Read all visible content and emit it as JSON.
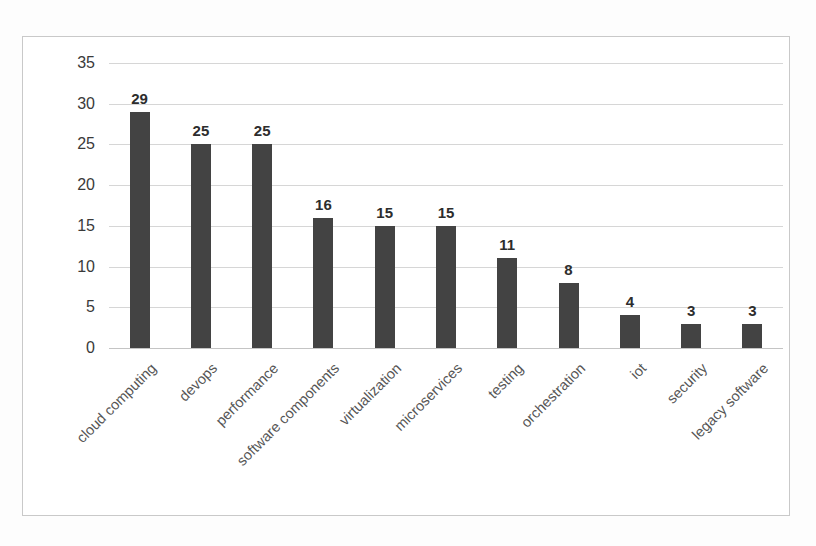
{
  "chart_data": {
    "type": "bar",
    "title": "",
    "xlabel": "",
    "ylabel": "",
    "ylim": [
      0,
      35
    ],
    "yticks": [
      0,
      5,
      10,
      15,
      20,
      25,
      30,
      35
    ],
    "grid": true,
    "legend": false,
    "bar_color": "#434343",
    "categories": [
      "cloud computing",
      "devops",
      "performance",
      "software components",
      "virtualization",
      "microservices",
      "testing",
      "orchestration",
      "iot",
      "security",
      "legacy software"
    ],
    "values": [
      29,
      25,
      25,
      16,
      15,
      15,
      11,
      8,
      4,
      3,
      3
    ],
    "value_labels": [
      "29",
      "25",
      "25",
      "16",
      "15",
      "15",
      "11",
      "8",
      "4",
      "3",
      "3"
    ],
    "ytick_labels": [
      "0",
      "5",
      "10",
      "15",
      "20",
      "25",
      "30",
      "35"
    ]
  }
}
